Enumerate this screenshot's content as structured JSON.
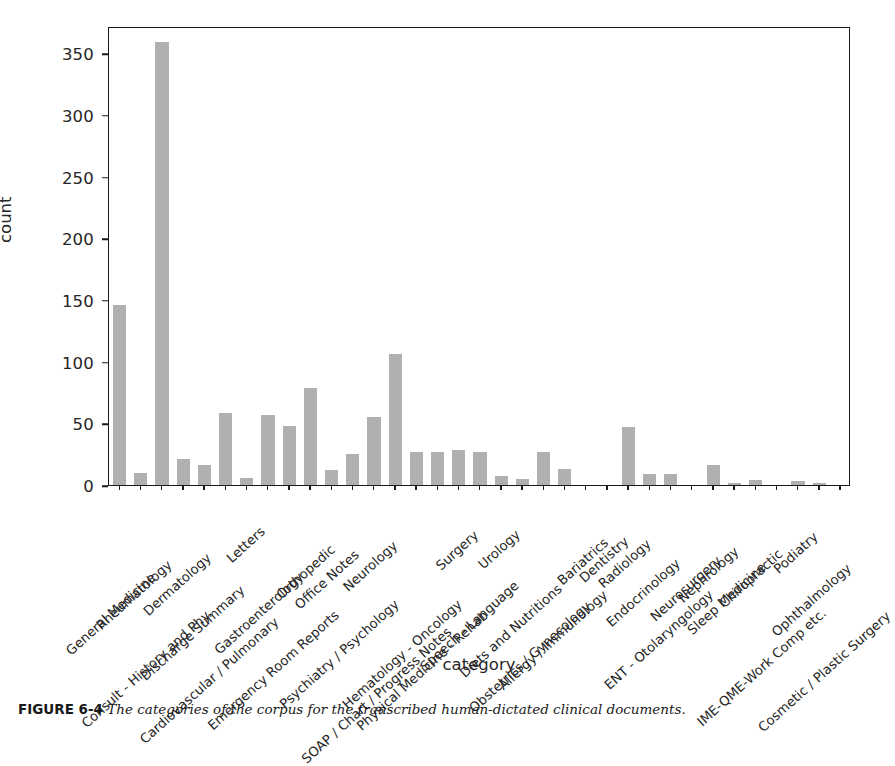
{
  "chart_data": {
    "type": "bar",
    "title": "",
    "xlabel": "category",
    "ylabel": "count",
    "ylim": [
      0,
      372
    ],
    "yticks": [
      0,
      50,
      100,
      150,
      200,
      250,
      300,
      350
    ],
    "grid": false,
    "legend": null,
    "bar_color": "#b0b0b0",
    "categories": [
      "General Medicine",
      "Rheumatology",
      "Consult - History and Phy.",
      "Dermatology",
      "Discharge Summary",
      "Cardiovascular / Pulmonary",
      "Letters",
      "Gastroenterology",
      "Emergency Room Reports",
      "Orthopedic",
      "Office Notes",
      "Psychiatry / Psychology",
      "Neurology",
      "SOAP / Chart / Progress Notes",
      "Hematology - Oncology",
      "Physical Medicine - Rehab",
      "Surgery",
      "Speech - Language",
      "Urology",
      "Diets and Nutritions",
      "Obstetrics / Gynecology",
      "Allergy / Immunology",
      "Bariatrics",
      "Dentistry",
      "Radiology",
      "Endocrinology",
      "ENT - Otolaryngology",
      "Neurosurgery",
      "Nephrology",
      "Sleep Medicine",
      "Chiropractic",
      "IME-QME-Work Comp etc.",
      "Podiatry",
      "Ophthalmology",
      "Cosmetic / Plastic Surgery"
    ],
    "values": [
      146,
      10,
      359,
      21,
      16,
      58,
      6,
      57,
      48,
      79,
      12,
      25,
      55,
      106,
      27,
      27,
      28,
      27,
      7,
      5,
      27,
      13,
      0,
      0,
      47,
      9,
      9,
      0,
      16,
      2,
      4,
      0,
      3,
      2,
      0
    ]
  },
  "axis": {
    "ylabel": "count",
    "xlabel": "category"
  },
  "caption": {
    "figure_number": "FIGURE 6-4",
    "text": "The categories of the corpus for the transcribed human-dictated clinical documents."
  }
}
